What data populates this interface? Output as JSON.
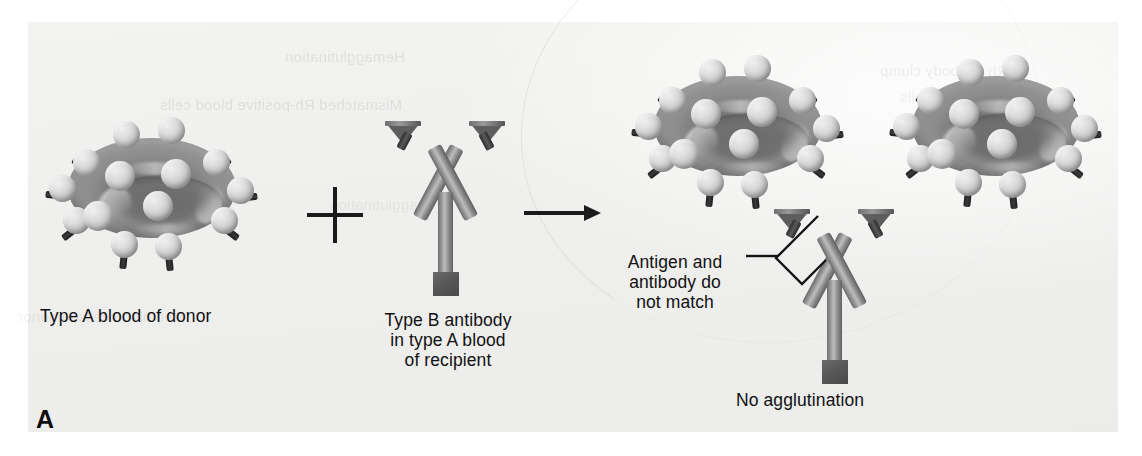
{
  "figure": {
    "panel_letter": "A",
    "background_color": "#efefed",
    "cell_color": "#8a8a8a",
    "antigen_color": "#d0d0d0",
    "antibody_color": "#9a9a9a",
    "ink_color": "#111111"
  },
  "labels": {
    "donor_cell": "Type A blood of donor",
    "antibody": "Type B antibody\nin type A blood\nof recipient",
    "no_match": "Antigen and\nantibody do\nnot match",
    "outcome": "No agglutination"
  },
  "symbols": {
    "plus": "plus-sign",
    "arrow": "right-arrow",
    "bracket": "callout-bracket"
  },
  "elements": {
    "donor_cell_name": "red-blood-cell-type-a",
    "antibody_name": "antibody-type-b",
    "result_cell_1": "red-blood-cell-result-1",
    "result_cell_2": "red-blood-cell-result-2",
    "result_antibody": "antibody-unbound"
  },
  "ghost_text": {
    "line1": "Hemagglutination",
    "line2": "Mismatched Rh-positive blood cells",
    "line3": "agglutination",
    "line4": "Rh antibody clump",
    "line5": "from the donor cells",
    "line6": "Red blood cells in donor"
  }
}
